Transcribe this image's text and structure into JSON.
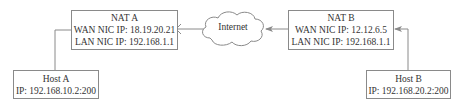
{
  "diagram": {
    "type": "network-topology",
    "nodes": {
      "nat_a": {
        "title": "NAT A",
        "wan": "WAN NIC IP: 18.19.20.21",
        "lan": "LAN NIC IP: 192.168.1.1"
      },
      "nat_b": {
        "title": "NAT B",
        "wan": "WAN NIC IP: 12.12.6.5",
        "lan": "LAN NIC IP: 192.168.1.1"
      },
      "host_a": {
        "title": "Host A",
        "ip": "IP: 192.168.10.2:200"
      },
      "host_b": {
        "title": "Host B",
        "ip": "IP: 192.168.20.2:200"
      },
      "internet": {
        "label": "Internet"
      }
    },
    "edges": [
      {
        "from": "host_a",
        "to": "nat_a",
        "style": "line"
      },
      {
        "from": "internet",
        "to": "nat_a",
        "style": "blocked",
        "marker": "x-mark"
      },
      {
        "from": "nat_b",
        "to": "internet",
        "style": "arrow"
      },
      {
        "from": "host_b",
        "to": "nat_b",
        "style": "arrow"
      }
    ],
    "colors": {
      "line": "#8a8a8a",
      "text": "#333333",
      "background": "#ffffff"
    }
  }
}
